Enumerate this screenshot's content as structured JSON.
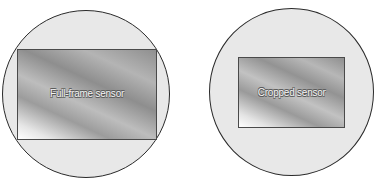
{
  "diagram": {
    "panels": [
      {
        "id": "full-frame",
        "circle_label": "lens image circle",
        "sensor_label": "Full-frame sensor"
      },
      {
        "id": "cropped",
        "circle_label": "lens image circle",
        "sensor_label": "Cropped sensor"
      }
    ]
  },
  "colors": {
    "circle_fill": "#e8e8e8",
    "circle_stroke": "#2a2a2a",
    "sensor_border": "#4a4a4a",
    "label_text": "#f2f2f2",
    "label_outline": "#5a5a5a",
    "background": "#ffffff"
  }
}
